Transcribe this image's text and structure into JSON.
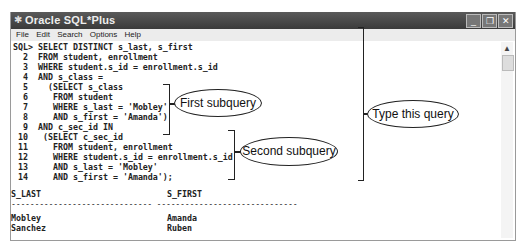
{
  "window": {
    "title": "Oracle SQL*Plus",
    "controls": {
      "minimize": "_",
      "restore": "❐",
      "close": "✕"
    }
  },
  "menubar": {
    "items": [
      "File",
      "Edit",
      "Search",
      "Options",
      "Help"
    ]
  },
  "console": {
    "lines": [
      "SQL> SELECT DISTINCT s_last, s_first",
      "  2  FROM student, enrollment",
      "  3  WHERE student.s_id = enrollment.s_id",
      "  4  AND s_class =",
      "  5    (SELECT s_class",
      "  6     FROM student",
      "  7     WHERE s_last = 'Mobley'",
      "  8     AND s_first = 'Amanda')",
      "  9  AND c_sec_id IN",
      " 10   (SELECT c_sec_id",
      " 11     FROM student, enrollment",
      " 12     WHERE student.s_id = enrollment.s_id",
      " 13     AND s_last = 'Mobley'",
      " 14     AND s_first = 'Amanda');"
    ],
    "result": {
      "columns": [
        "S_LAST",
        "S_FIRST"
      ],
      "separator": "------------------------------ ------------------------------",
      "rows": [
        [
          "Mobley",
          "Amanda"
        ],
        [
          "Sanchez",
          "Ruben"
        ]
      ]
    }
  },
  "callouts": {
    "first": "First subquery",
    "second": "Second subquery",
    "whole": "Type this query"
  }
}
